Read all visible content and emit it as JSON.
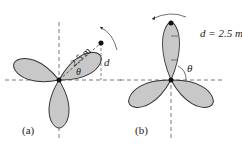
{
  "panels": [
    {
      "id": "a",
      "label": "(a)",
      "distance_label": "2.5 m",
      "angle_label": "θ",
      "d_label": "d"
    },
    {
      "id": "b",
      "label": "(b)",
      "distance_label": "d = 2.5 m",
      "angle_label": "θ"
    }
  ],
  "colors": {
    "blade_fill": "#c8c8c8",
    "outline": "#333333",
    "dash": "#555555"
  }
}
